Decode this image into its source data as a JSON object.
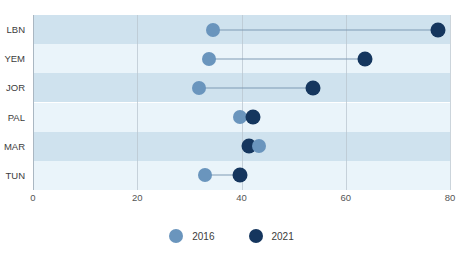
{
  "chart_data": {
    "type": "scatter",
    "subtype": "dumbbell",
    "title": "",
    "xlabel": "",
    "ylabel": "",
    "categories": [
      "LBN",
      "YEM",
      "JOR",
      "PAL",
      "MAR",
      "TUN"
    ],
    "series": [
      {
        "name": "2016",
        "color": "#6a95bd",
        "values": [
          34.5,
          33.8,
          31.9,
          39.7,
          43.4,
          33.0
        ]
      },
      {
        "name": "2021",
        "color": "#15365e",
        "values": [
          77.7,
          63.7,
          53.7,
          42.2,
          41.5,
          39.8
        ]
      }
    ],
    "xlim": [
      0,
      80
    ],
    "xticks": [
      0,
      20,
      40,
      60,
      80
    ],
    "xtick_labels": [
      "0",
      "20",
      "40",
      "60",
      "80"
    ],
    "grid": true,
    "grid_axis": "x",
    "legend_position": "bottom",
    "band_colors": [
      "#cfe2ee",
      "#eaf4fa"
    ],
    "connector_color": "#7e9ab4"
  },
  "legend": {
    "items": [
      {
        "label": "2016",
        "color": "#6a95bd"
      },
      {
        "label": "2021",
        "color": "#15365e"
      }
    ]
  }
}
